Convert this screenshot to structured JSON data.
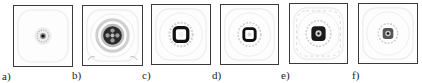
{
  "figure": {
    "panels": [
      {
        "id": "a",
        "label": "a)",
        "box": [
          13,
          5,
          60,
          62
        ],
        "label_pos": [
          2,
          71
        ],
        "pattern": "small-dot"
      },
      {
        "id": "b",
        "label": "b)",
        "box": [
          82,
          5,
          61,
          61
        ],
        "label_pos": [
          72,
          70
        ],
        "pattern": "large-cross-ring"
      },
      {
        "id": "c",
        "label": "c)",
        "box": [
          151,
          4,
          60,
          61
        ],
        "label_pos": [
          142,
          70
        ],
        "pattern": "square-ring"
      },
      {
        "id": "d",
        "label": "d)",
        "box": [
          220,
          4,
          59,
          61
        ],
        "label_pos": [
          212,
          70
        ],
        "pattern": "square-ring-bright-center"
      },
      {
        "id": "e",
        "label": "e)",
        "box": [
          289,
          3,
          59,
          61
        ],
        "label_pos": [
          281,
          70
        ],
        "pattern": "square-ring-dot"
      },
      {
        "id": "f",
        "label": "f)",
        "box": [
          358,
          3,
          60,
          61
        ],
        "label_pos": [
          352,
          70
        ],
        "pattern": "small-ring-dot"
      }
    ],
    "colors": {
      "frame": "#3a3a3a",
      "dark": "#111111",
      "mid": "#777777",
      "light": "#cfcfcf",
      "faint": "#ececec"
    }
  }
}
